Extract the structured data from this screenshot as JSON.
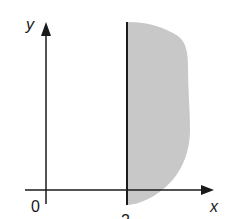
{
  "diagram": {
    "type": "region-sketch",
    "axes": {
      "x_label": "x",
      "y_label": "y",
      "origin_label": "0"
    },
    "vertical_line": {
      "x_value_label": "2"
    },
    "region": {
      "description": "shaded region to the right of x = 2",
      "fill_color": "#c8c8c8"
    },
    "colors": {
      "axis": "#1a1a1a",
      "background": "#ffffff"
    }
  }
}
